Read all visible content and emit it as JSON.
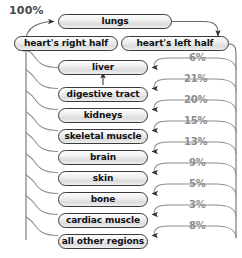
{
  "diagram": {
    "title_label": "100%",
    "nodes": [
      {
        "id": "lungs",
        "label": "lungs",
        "x": 58,
        "y": 14,
        "w": 114
      },
      {
        "id": "heart-right",
        "label": "heart's right half",
        "x": 14,
        "y": 36,
        "w": 104
      },
      {
        "id": "heart-left",
        "label": "heart's left half",
        "x": 121,
        "y": 36,
        "w": 108
      },
      {
        "id": "liver",
        "label": "liver",
        "x": 58,
        "y": 60,
        "w": 90
      },
      {
        "id": "digestive-tract",
        "label": "digestive tract",
        "x": 58,
        "y": 87,
        "w": 90
      },
      {
        "id": "kidneys",
        "label": "kidneys",
        "x": 58,
        "y": 108,
        "w": 90
      },
      {
        "id": "skeletal-muscle",
        "label": "skeletal muscle",
        "x": 58,
        "y": 129,
        "w": 90
      },
      {
        "id": "brain",
        "label": "brain",
        "x": 58,
        "y": 150,
        "w": 90
      },
      {
        "id": "skin",
        "label": "skin",
        "x": 58,
        "y": 171,
        "w": 90
      },
      {
        "id": "bone",
        "label": "bone",
        "x": 58,
        "y": 192,
        "w": 90
      },
      {
        "id": "cardiac-muscle",
        "label": "cardiac muscle",
        "x": 58,
        "y": 213,
        "w": 90
      },
      {
        "id": "all-other",
        "label": "all other regions",
        "x": 58,
        "y": 234,
        "w": 90
      }
    ],
    "percentages": [
      {
        "target": "liver",
        "value": "6%",
        "x": 189,
        "y": 58
      },
      {
        "target": "digestive-tract",
        "value": "21%",
        "x": 184,
        "y": 79
      },
      {
        "target": "kidneys",
        "value": "20%",
        "x": 184,
        "y": 100
      },
      {
        "target": "skeletal-muscle",
        "value": "15%",
        "x": 184,
        "y": 121
      },
      {
        "target": "brain",
        "value": "13%",
        "x": 184,
        "y": 142
      },
      {
        "target": "skin",
        "value": "9%",
        "x": 189,
        "y": 163
      },
      {
        "target": "bone",
        "value": "5%",
        "x": 189,
        "y": 184
      },
      {
        "target": "cardiac-muscle",
        "value": "3%",
        "x": 189,
        "y": 205
      },
      {
        "target": "all-other",
        "value": "8%",
        "x": 189,
        "y": 226
      }
    ],
    "colors": {
      "node_border": "#3a3a3a",
      "node_text": "#111111",
      "percent_text": "#8d8d8d",
      "total_text": "#4a4a4a",
      "wire": "#555555",
      "background": "#ffffff"
    }
  }
}
